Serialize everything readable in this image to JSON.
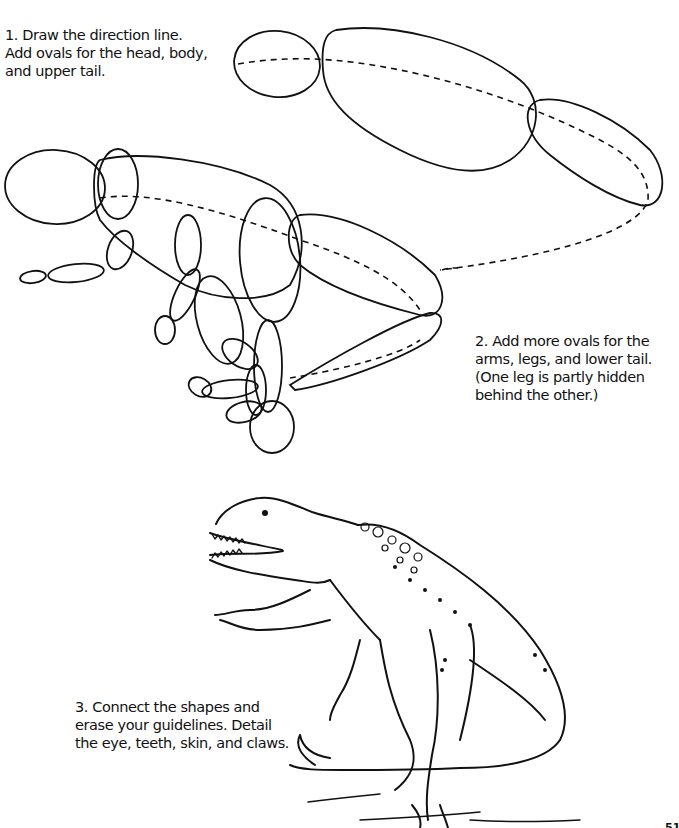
{
  "steps": [
    {
      "number": "1",
      "lines": [
        "1. Draw the direction line.",
        "Add ovals for the head, body,",
        "and upper tail."
      ],
      "illustration": "direction-line-with-head-body-tail-ovals"
    },
    {
      "number": "2",
      "lines": [
        "2. Add more ovals for the",
        "arms, legs, and lower tail.",
        "(One leg is partly hidden",
        "behind the other.)"
      ],
      "illustration": "ovals-for-arms-legs-lower-tail"
    },
    {
      "number": "3",
      "lines": [
        "3. Connect the shapes and",
        "erase your guidelines. Detail",
        "the eye, teeth, skin, and claws."
      ],
      "illustration": "finished-dinosaur-drawing"
    }
  ],
  "page_number": "51",
  "colors": {
    "ink": "#111111",
    "paper": "#ffffff"
  }
}
